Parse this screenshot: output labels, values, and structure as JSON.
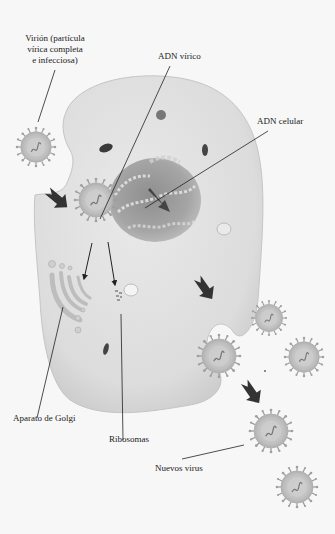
{
  "diagram": {
    "colors": {
      "background": "#f7f7f7",
      "cell": "#dedede",
      "cell_edge": "#c9c9c9",
      "nucleus": "#9a9a9a",
      "virus": "#b5b5b5",
      "arrow": "#333333",
      "leader_line": "#222222"
    },
    "labels": {
      "virion": [
        "Virión (partícula",
        "vírica completa",
        "e infecciosa)"
      ],
      "viral_dna": "ADN vírico",
      "cell_dna": "ADN celular",
      "golgi": "Aparato de Golgi",
      "ribosomes": "Ribosomas",
      "new_viruses": "Nuevos virus"
    },
    "components": [
      {
        "id": "virion",
        "icon": "virus-particle-icon"
      },
      {
        "id": "host-cell",
        "icon": "cell-icon"
      },
      {
        "id": "nucleus",
        "icon": "nucleus-icon"
      },
      {
        "id": "golgi",
        "icon": "golgi-apparatus-icon"
      },
      {
        "id": "ribosomes",
        "icon": "ribosome-icon"
      },
      {
        "id": "new-viruses",
        "icon": "virus-particle-icon",
        "count": 4
      }
    ]
  }
}
